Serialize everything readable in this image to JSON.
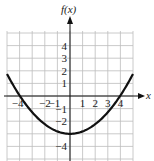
{
  "chart_data": {
    "type": "line",
    "title": "",
    "xlabel": "x",
    "ylabel": "f(x)",
    "xlim": [
      -5,
      5
    ],
    "ylim": [
      -5,
      5.2
    ],
    "grid": true,
    "x_ticks": [
      "-4",
      "-2",
      "-1",
      "1",
      "2",
      "3",
      "4"
    ],
    "y_ticks": [
      "4",
      "3",
      "2",
      "1",
      "-1",
      "-2",
      "-4"
    ],
    "series": [
      {
        "name": "f(x)",
        "function": "parabola opening upward, vertex (0, -3), x-intercepts near ±3.9",
        "x": [
          -5,
          -4,
          -3,
          -2,
          -1,
          0,
          1,
          2,
          3,
          4,
          5
        ],
        "values": [
          1.8,
          0.1,
          -1.3,
          -2.2,
          -2.8,
          -3,
          -2.8,
          -2.2,
          -1.3,
          0.1,
          1.8
        ]
      }
    ]
  },
  "labels": {
    "y_axis": "f(x)",
    "x_axis": "x"
  }
}
